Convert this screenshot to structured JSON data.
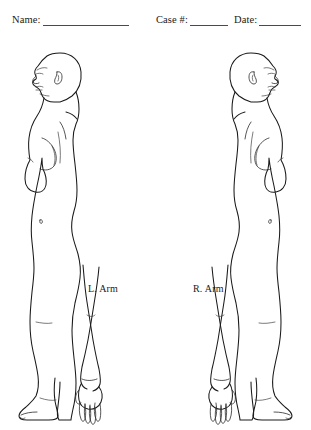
{
  "page": {
    "background_color": "#ffffff",
    "ink_color": "#1a1a1a",
    "rule_color": "#4a4a4a"
  },
  "header": {
    "fields": [
      {
        "label": "Name:",
        "value": "",
        "rule_width_px": 86
      },
      {
        "label": "Case #:",
        "value": "",
        "rule_width_px": 38
      },
      {
        "label": "Date:",
        "value": "",
        "rule_width_px": 42
      }
    ],
    "name_label": "Name:",
    "case_label": "Case #:",
    "date_label": "Date:"
  },
  "diagram": {
    "title": "",
    "view": "lateral profile",
    "figure_count": 2,
    "figures": [
      {
        "name": "left-lateral-figure",
        "facing": "left",
        "side": "L",
        "detached_arm_label": "L. Arm"
      },
      {
        "name": "right-lateral-figure",
        "facing": "right",
        "side": "R",
        "detached_arm_label": "R. Arm"
      }
    ],
    "labels": {
      "left_arm": "L. Arm",
      "right_arm": "R. Arm"
    }
  }
}
